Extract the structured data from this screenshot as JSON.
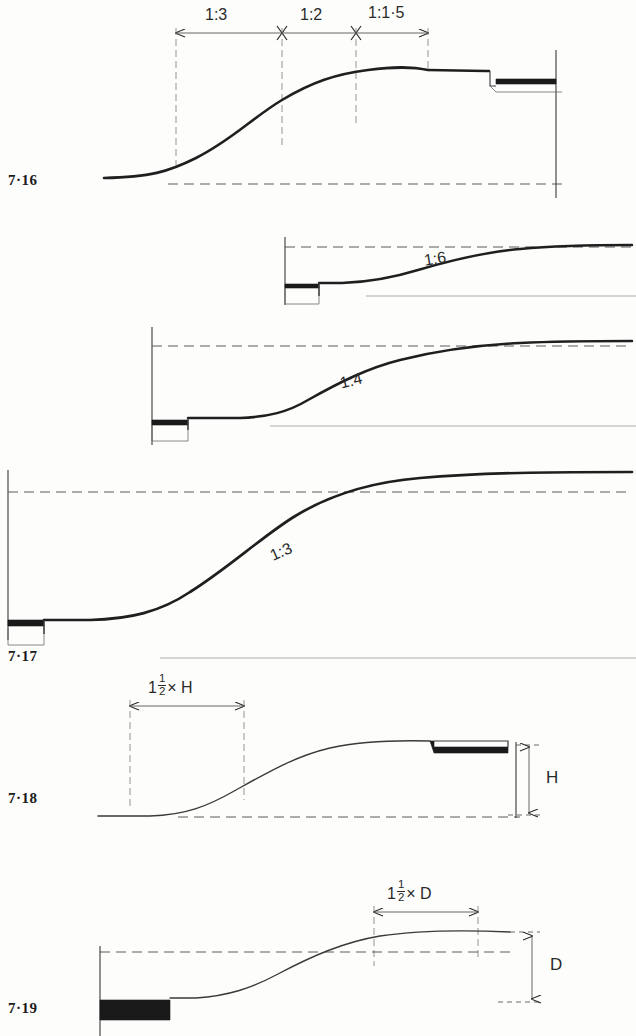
{
  "document": {
    "kind": "engineering-section-drawings",
    "page_background": "#fdfdfc",
    "ink_color": "#1f1f1f",
    "solid_fill_color": "#1a1a1a"
  },
  "figures": [
    {
      "number": "7·16",
      "slope_labels": [],
      "dimension_chain": [
        {
          "label": "1:3"
        },
        {
          "label": "1:2"
        },
        {
          "label": "1:1·5"
        }
      ]
    },
    {
      "number": "",
      "slope_labels": [
        {
          "label": "1:6"
        }
      ],
      "dimension_chain": []
    },
    {
      "number": "",
      "slope_labels": [
        {
          "label": "1:4"
        }
      ],
      "dimension_chain": []
    },
    {
      "number": "7·17",
      "slope_labels": [
        {
          "label": "1:3"
        }
      ],
      "dimension_chain": []
    },
    {
      "number": "7·18",
      "slope_labels": [],
      "dimension_chain": [
        {
          "label": "1½ × H"
        }
      ],
      "vertical_dimension": {
        "label": "H"
      }
    },
    {
      "number": "7·19",
      "slope_labels": [],
      "dimension_chain": [
        {
          "label": "1½ × D"
        }
      ],
      "vertical_dimension": {
        "label": "D"
      }
    }
  ],
  "labels": {
    "fig_716": "7·16",
    "fig_717": "7·17",
    "fig_718": "7·18",
    "fig_719": "7·19",
    "ratio_1_3_a": "1:3",
    "ratio_1_2": "1:2",
    "ratio_1_1_5": "1:1·5",
    "ratio_1_6": "1:6",
    "ratio_1_4": "1:4",
    "ratio_1_3_b": "1:3",
    "half_h_prefix": "1",
    "half_h_num": "1",
    "half_h_den": "2",
    "half_h_suffix": "× H",
    "half_d_prefix": "1",
    "half_d_num": "1",
    "half_d_den": "2",
    "half_d_suffix": "× D",
    "dim_h": "H",
    "dim_d": "D"
  }
}
